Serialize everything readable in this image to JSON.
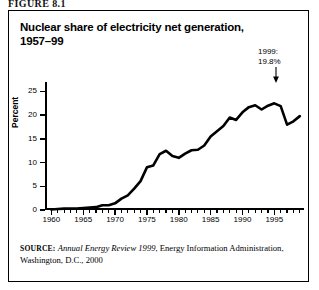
{
  "figure_label": "FIGURE 8.1",
  "title": {
    "line1": "Nuclear share of electricity net generation,",
    "line2": "1957–99"
  },
  "annotation": {
    "line1": "1999:",
    "line2": "19.8%",
    "arrow": "down-arrow-icon"
  },
  "source": {
    "prefix": "SOURCE:",
    "italic_part": "Annual Energy Review 1999",
    "rest": ", Energy Information Administration, Washington, D.C., 2000"
  },
  "colors": {
    "line": "#000000",
    "axis": "#000000",
    "background": "#ffffff",
    "frame": "#000000"
  },
  "chart_data": {
    "type": "line",
    "title": "Nuclear share of electricity net generation, 1957–99",
    "xlabel": "",
    "ylabel": "Percent",
    "xlim": [
      1959,
      1999.5
    ],
    "ylim": [
      0,
      27
    ],
    "grid": false,
    "legend": "none",
    "y_ticks": [
      0,
      5,
      10,
      15,
      20,
      25
    ],
    "x_ticks_major": [
      1960,
      1965,
      1970,
      1975,
      1980,
      1985,
      1990,
      1995
    ],
    "x_tick_minor_step": 1,
    "annotations": [
      {
        "x": 1999,
        "y": 19.8,
        "text": "1999: 19.8%"
      }
    ],
    "series": [
      {
        "name": "Nuclear share of electricity net generation",
        "x": [
          1960,
          1961,
          1962,
          1963,
          1964,
          1965,
          1966,
          1967,
          1968,
          1969,
          1970,
          1971,
          1972,
          1973,
          1974,
          1975,
          1976,
          1977,
          1978,
          1979,
          1980,
          1981,
          1982,
          1983,
          1984,
          1985,
          1986,
          1987,
          1988,
          1989,
          1990,
          1991,
          1992,
          1993,
          1994,
          1995,
          1996,
          1997,
          1998,
          1999
        ],
        "values": [
          0.1,
          0.2,
          0.3,
          0.3,
          0.3,
          0.4,
          0.5,
          0.6,
          1.0,
          1.0,
          1.4,
          2.4,
          3.1,
          4.5,
          6.1,
          9.0,
          9.4,
          11.8,
          12.5,
          11.4,
          11.0,
          11.9,
          12.6,
          12.7,
          13.6,
          15.5,
          16.6,
          17.7,
          19.5,
          19.0,
          20.6,
          21.7,
          22.1,
          21.2,
          22.0,
          22.5,
          21.9,
          18.0,
          18.7,
          19.8
        ]
      }
    ]
  }
}
